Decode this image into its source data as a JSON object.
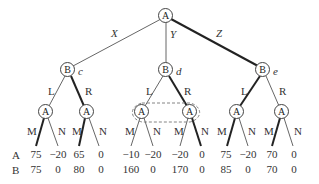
{
  "root": {
    "player": "A"
  },
  "moves_A": [
    "X",
    "Y",
    "Z"
  ],
  "b_nodes": [
    {
      "player": "B",
      "label": "c",
      "moves": [
        "L",
        "R"
      ]
    },
    {
      "player": "B",
      "label": "d",
      "moves": [
        "L",
        "R"
      ]
    },
    {
      "player": "B",
      "label": "e",
      "moves": [
        "L",
        "R"
      ]
    }
  ],
  "a_nodes": [
    {
      "player": "A",
      "moves": [
        "M",
        "N"
      ]
    },
    {
      "player": "A",
      "moves": [
        "M",
        "N"
      ]
    },
    {
      "player": "A",
      "moves": [
        "M",
        "N"
      ]
    },
    {
      "player": "A",
      "moves": [
        "M",
        "N"
      ]
    },
    {
      "player": "A",
      "moves": [
        "M",
        "N"
      ]
    },
    {
      "player": "A",
      "moves": [
        "M",
        "N"
      ]
    }
  ],
  "payoff_rows": {
    "a_label": "A",
    "b_label": "B"
  },
  "payoffs_A": [
    "75",
    "−20",
    "65",
    "0",
    "−10",
    "−20",
    "−20",
    "0",
    "75",
    "−20",
    "70",
    "0"
  ],
  "payoffs_B": [
    "75",
    "0",
    "80",
    "0",
    "160",
    "0",
    "170",
    "0",
    "85",
    "0",
    "70",
    "0"
  ]
}
